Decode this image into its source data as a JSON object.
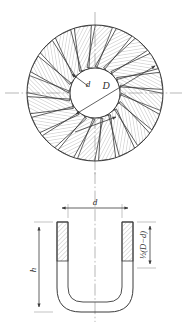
{
  "figure": {
    "line_color": "#3a3a3a",
    "hatch_color": "#8d8d8d",
    "centerline_color": "#9a9a9a",
    "background": "#ffffff"
  },
  "plan_view": {
    "name": "plan-view",
    "blade_count": 20,
    "inner_diameter_label": "d",
    "outer_diameter_label": "D",
    "outer_circle": {
      "cx": 95,
      "cy": 93,
      "r": 68
    },
    "inner_circle": {
      "cx": 95,
      "cy": 93,
      "r": 25
    }
  },
  "section_view": {
    "name": "section-view",
    "width_label": "d",
    "height_label": "h",
    "wall_thickness_label": "½(D−d)",
    "wall_thickness_fraction": {
      "numerator": "1",
      "denominator": "2",
      "expression": "(D−d)"
    }
  },
  "caption": {
    "text": ""
  }
}
